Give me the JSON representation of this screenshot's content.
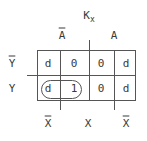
{
  "title": {
    "main": "K",
    "subscript": "x"
  },
  "column_headers": {
    "top": [
      {
        "label": "A",
        "overline": true
      },
      {
        "label": "A",
        "overline": false
      }
    ],
    "bottom": [
      {
        "label": "X",
        "overline": true
      },
      {
        "label": "X",
        "overline": false
      },
      {
        "label": "X",
        "overline": true
      }
    ]
  },
  "row_headers": [
    {
      "label": "Y",
      "overline": true
    },
    {
      "label": "Y",
      "overline": false
    }
  ],
  "cells": [
    [
      "d",
      "0",
      "0",
      "d"
    ],
    [
      "d",
      "1",
      "0",
      "d"
    ]
  ],
  "grouping": {
    "description": "loop around row Y, columns 1-2",
    "row": 1,
    "cols": [
      0,
      1
    ]
  }
}
